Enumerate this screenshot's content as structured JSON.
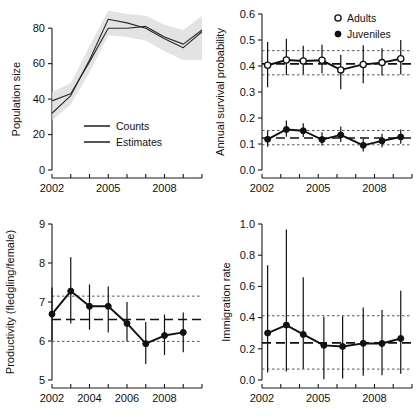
{
  "figure": {
    "panel_count": 4,
    "background": "#ffffff",
    "ink_color": "#111111",
    "band_color": "#d9d9d9"
  },
  "chart_data": [
    {
      "id": "population-size",
      "position": "top-left",
      "type": "line",
      "title": "",
      "xlabel": "",
      "ylabel": "Population size",
      "xlim": [
        2002,
        2010
      ],
      "ylim": [
        0,
        88
      ],
      "yticks": [
        0,
        20,
        40,
        60,
        80
      ],
      "ytick_labels": [
        "0",
        "20",
        "40",
        "60",
        "80"
      ],
      "xticks": [
        2002,
        2003,
        2004,
        2005,
        2006,
        2007,
        2008,
        2009,
        2010
      ],
      "xtick_labels": [
        "2002",
        "",
        "",
        "2005",
        "",
        "",
        "2008",
        "",
        ""
      ],
      "grid": false,
      "legend_position": "inside-lower-center",
      "x": [
        2002,
        2003,
        2004,
        2005,
        2006,
        2007,
        2008,
        2009,
        2010
      ],
      "series": [
        {
          "name": "Counts",
          "style": "solid-thin",
          "values": [
            39,
            43,
            61,
            80,
            80,
            81,
            75,
            71,
            79
          ]
        },
        {
          "name": "Estimates",
          "style": "solid-thin",
          "values": [
            32,
            42,
            62,
            85,
            83,
            80,
            74,
            69,
            78
          ]
        }
      ],
      "band": {
        "name": "95% credible interval",
        "lower": [
          28,
          37,
          55,
          76,
          75,
          73,
          67,
          62,
          62
        ],
        "upper": [
          44,
          49,
          70,
          90,
          88,
          87,
          82,
          79,
          87
        ]
      }
    },
    {
      "id": "annual-survival-probability",
      "position": "top-right",
      "type": "line",
      "title": "",
      "xlabel": "",
      "ylabel": "Annual survival probability",
      "xlim": [
        2002,
        2010
      ],
      "ylim": [
        0.0,
        0.6
      ],
      "yticks": [
        0.0,
        0.1,
        0.2,
        0.3,
        0.4,
        0.5,
        0.6
      ],
      "ytick_labels": [
        "0.0",
        "0.1",
        "0.2",
        "0.3",
        "0.4",
        "0.5",
        "0.6"
      ],
      "xticks": [
        2002,
        2003,
        2004,
        2005,
        2006,
        2007,
        2008,
        2009,
        2010
      ],
      "xtick_labels": [
        "2002",
        "",
        "",
        "2005",
        "",
        "",
        "2008",
        "",
        ""
      ],
      "grid": false,
      "legend_position": "top-right-inside",
      "x": [
        2002.3,
        2003.3,
        2004.2,
        2005.2,
        2006.2,
        2007.4,
        2008.4,
        2009.4
      ],
      "series": [
        {
          "name": "Adults",
          "marker": "open-circle",
          "values": [
            0.403,
            0.423,
            0.419,
            0.422,
            0.385,
            0.406,
            0.413,
            0.428
          ],
          "err_low": [
            0.318,
            0.365,
            0.368,
            0.372,
            0.311,
            0.334,
            0.363,
            0.367
          ],
          "err_high": [
            0.492,
            0.505,
            0.478,
            0.482,
            0.443,
            0.48,
            0.468,
            0.5
          ],
          "mean": 0.408,
          "ci_low": 0.366,
          "ci_high": 0.459
        },
        {
          "name": "Juveniles",
          "marker": "filled-circle",
          "values": [
            0.118,
            0.156,
            0.151,
            0.117,
            0.135,
            0.095,
            0.112,
            0.127
          ],
          "err_low": [
            0.089,
            0.128,
            0.127,
            0.094,
            0.108,
            0.071,
            0.087,
            0.101
          ],
          "err_high": [
            0.15,
            0.19,
            0.18,
            0.145,
            0.167,
            0.12,
            0.139,
            0.156
          ],
          "mean": 0.123,
          "ci_low": 0.097,
          "ci_high": 0.152
        }
      ]
    },
    {
      "id": "productivity",
      "position": "bottom-left",
      "type": "line",
      "title": "",
      "xlabel": "",
      "ylabel": "Productivity (fledgling/female)",
      "xlim": [
        2002,
        2010
      ],
      "ylim": [
        5,
        9
      ],
      "yticks": [
        5,
        6,
        7,
        8,
        9
      ],
      "ytick_labels": [
        "5",
        "6",
        "7",
        "8",
        "9"
      ],
      "xticks": [
        2002,
        2003,
        2004,
        2005,
        2006,
        2007,
        2008,
        2009,
        2010
      ],
      "xtick_labels": [
        "2002",
        "",
        "2004",
        "",
        "2006",
        "",
        "2008",
        "",
        ""
      ],
      "grid": false,
      "legend_position": "none",
      "x": [
        2002,
        2003,
        2004,
        2005,
        2006,
        2007,
        2008,
        2009
      ],
      "series": [
        {
          "name": "Productivity",
          "marker": "filled-circle",
          "values": [
            6.69,
            7.28,
            6.89,
            6.89,
            6.45,
            5.93,
            6.14,
            6.22
          ],
          "err_low": [
            6.02,
            6.45,
            6.29,
            6.22,
            5.99,
            5.41,
            5.64,
            5.71
          ],
          "err_high": [
            7.37,
            8.15,
            7.45,
            7.4,
            7.0,
            6.49,
            6.68,
            6.73
          ],
          "mean": 6.55,
          "ci_low": 5.99,
          "ci_high": 7.15
        }
      ]
    },
    {
      "id": "immigration-rate",
      "position": "bottom-right",
      "type": "line",
      "title": "",
      "xlabel": "",
      "ylabel": "Immigration rate",
      "xlim": [
        2002,
        2010
      ],
      "ylim": [
        0.0,
        1.0
      ],
      "yticks": [
        0.0,
        0.2,
        0.4,
        0.6,
        0.8,
        1.0
      ],
      "ytick_labels": [
        "0.0",
        "0.2",
        "0.4",
        "0.6",
        "0.8",
        "1.0"
      ],
      "xticks": [
        2002,
        2003,
        2004,
        2005,
        2006,
        2007,
        2008,
        2009,
        2010
      ],
      "xtick_labels": [
        "2002",
        "",
        "",
        "2005",
        "",
        "",
        "2008",
        "",
        ""
      ],
      "grid": false,
      "legend_position": "none",
      "x": [
        2002.3,
        2003.3,
        2004.2,
        2005.3,
        2006.3,
        2007.4,
        2008.4,
        2009.4
      ],
      "series": [
        {
          "name": "Immigration rate",
          "marker": "filled-circle",
          "values": [
            0.301,
            0.352,
            0.292,
            0.222,
            0.215,
            0.235,
            0.234,
            0.266
          ],
          "err_low": [
            0.048,
            0.055,
            0.072,
            0.005,
            0.01,
            0.028,
            0.03,
            0.04
          ],
          "err_high": [
            0.735,
            0.965,
            0.658,
            0.405,
            0.408,
            0.465,
            0.448,
            0.572
          ],
          "mean": 0.238,
          "ci_low": 0.07,
          "ci_high": 0.412
        }
      ]
    }
  ]
}
